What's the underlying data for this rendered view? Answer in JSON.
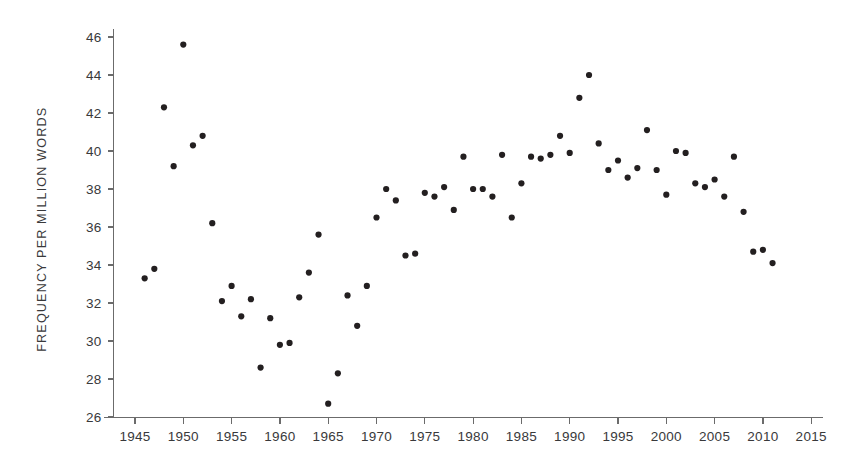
{
  "figure": {
    "background_color": "#ffffff",
    "dot_color": "#231f20",
    "axis_color": "#6b6b6b",
    "text_color": "#39393b"
  },
  "axes": {
    "y_title": "FREQUENCY PER MILLION WORDS",
    "x_title": "",
    "y_ticks": [
      26,
      28,
      30,
      32,
      34,
      36,
      38,
      40,
      42,
      44,
      46
    ],
    "x_ticks": [
      1945,
      1950,
      1955,
      1960,
      1965,
      1970,
      1975,
      1980,
      1985,
      1990,
      1995,
      2000,
      2005,
      2010,
      2015
    ]
  },
  "chart_data": {
    "type": "scatter",
    "title": "",
    "xlabel": "",
    "ylabel": "FREQUENCY PER MILLION WORDS",
    "xlim": [
      1942.5,
      2016.5
    ],
    "ylim": [
      25.4,
      46.6
    ],
    "grid": false,
    "legend": null,
    "series": [
      {
        "name": "frequency per million words",
        "marker": "filled-circle",
        "color": "#231f20",
        "x": [
          1946,
          1947,
          1948,
          1949,
          1950,
          1951,
          1952,
          1953,
          1954,
          1955,
          1956,
          1957,
          1958,
          1959,
          1960,
          1961,
          1962,
          1963,
          1964,
          1965,
          1966,
          1967,
          1968,
          1969,
          1970,
          1971,
          1972,
          1973,
          1974,
          1975,
          1976,
          1977,
          1978,
          1979,
          1980,
          1981,
          1982,
          1983,
          1984,
          1985,
          1986,
          1987,
          1988,
          1989,
          1990,
          1991,
          1992,
          1993,
          1994,
          1995,
          1996,
          1997,
          1998,
          1999,
          2000,
          2001,
          2002,
          2003,
          2004,
          2005,
          2006,
          2007,
          2008,
          2009,
          2010,
          2011
        ],
        "y": [
          33.3,
          33.8,
          42.3,
          39.2,
          45.6,
          40.3,
          40.8,
          36.2,
          32.1,
          32.9,
          31.3,
          32.2,
          28.6,
          31.2,
          29.8,
          29.9,
          32.3,
          33.6,
          35.6,
          26.7,
          28.3,
          32.4,
          30.8,
          32.9,
          36.5,
          38.0,
          37.4,
          34.5,
          34.6,
          37.8,
          37.6,
          38.1,
          36.9,
          39.7,
          38.0,
          38.0,
          37.6,
          39.8,
          36.5,
          38.3,
          39.7,
          39.6,
          39.8,
          40.8,
          39.9,
          42.8,
          44.0,
          40.4,
          39.0,
          39.5,
          38.6,
          39.1,
          41.1,
          39.0,
          37.7,
          40.0,
          39.9,
          38.3,
          38.1,
          38.5,
          37.6,
          39.7,
          36.8,
          34.7,
          34.8,
          34.1
        ]
      }
    ]
  }
}
